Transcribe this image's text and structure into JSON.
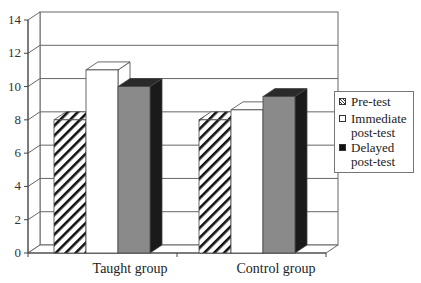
{
  "chart_data": {
    "type": "bar",
    "style": "3d-clustered-column",
    "title": "",
    "xlabel": "",
    "ylabel": "",
    "categories": [
      "Taught group",
      "Control group"
    ],
    "series": [
      {
        "name": "Pre-test",
        "values": [
          8.0,
          8.0
        ],
        "fill": "hatched"
      },
      {
        "name": "Immediate post-test",
        "values": [
          11.0,
          8.6
        ],
        "fill": "#ffffff"
      },
      {
        "name": "Delayed post-test",
        "values": [
          10.0,
          9.4
        ],
        "fill": "#888888"
      }
    ],
    "ylim": [
      0,
      14
    ],
    "yticks": [
      0,
      2,
      4,
      6,
      8,
      10,
      12,
      14
    ],
    "grid": true,
    "legend_position": "right"
  },
  "axis": {
    "yticks": [
      "0",
      "2",
      "4",
      "6",
      "8",
      "10",
      "12",
      "14"
    ]
  },
  "categories": {
    "taught": "Taught group",
    "control": "Control group"
  },
  "legend": {
    "pre": "Pre-test",
    "immediate_1": "Immediate",
    "immediate_2": "post-test",
    "delayed_1": "Delayed",
    "delayed_2": "post-test"
  },
  "colors": {
    "grid": "#666666",
    "delayed_front": "#8a8a8a",
    "delayed_side": "#1a1a1a",
    "immediate": "#ffffff",
    "hatch": "#111111"
  }
}
